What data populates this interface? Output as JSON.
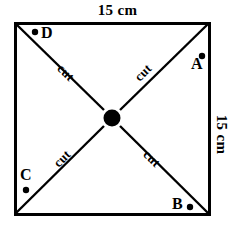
{
  "figure": {
    "colors": {
      "stroke": "#000000",
      "fill": "#ffffff",
      "center_dot": "#000000",
      "marker_dot": "#000000"
    },
    "square": {
      "x": 14,
      "y": 22,
      "width": 196,
      "height": 193,
      "stroke_width": 3
    },
    "center_dot": {
      "cx": 112,
      "cy": 118,
      "r": 8
    },
    "dimensions": [
      {
        "id": "top",
        "text": "15 cm",
        "rotation": 0,
        "side": "top"
      },
      {
        "id": "right",
        "text": "15 cm",
        "rotation": 90,
        "side": "right"
      }
    ],
    "corner_labels": [
      {
        "id": "a",
        "text": "A",
        "dot_position": "upper-right",
        "corner": "top-right"
      },
      {
        "id": "b",
        "text": "B",
        "dot_position": "right",
        "corner": "bottom-right"
      },
      {
        "id": "c",
        "text": "C",
        "dot_position": "below",
        "corner": "bottom-left"
      },
      {
        "id": "d",
        "text": "D",
        "dot_position": "left",
        "corner": "top-left"
      }
    ],
    "cut_labels": [
      {
        "id": "tl",
        "text": "cut",
        "rotation": 45,
        "arm": "top-left"
      },
      {
        "id": "tr",
        "text": "cut",
        "rotation": -45,
        "arm": "top-right"
      },
      {
        "id": "bl",
        "text": "cut",
        "rotation": -45,
        "arm": "bottom-left"
      },
      {
        "id": "br",
        "text": "cut",
        "rotation": 45,
        "arm": "bottom-right"
      }
    ],
    "diagonals": [
      {
        "id": "tl-arm",
        "x1": 15,
        "y1": 23,
        "x2": 104,
        "y2": 110
      },
      {
        "id": "tr-arm",
        "x1": 209,
        "y1": 23,
        "x2": 120,
        "y2": 110
      },
      {
        "id": "bl-arm",
        "x1": 15,
        "y1": 214,
        "x2": 104,
        "y2": 126
      },
      {
        "id": "br-arm",
        "x1": 209,
        "y1": 214,
        "x2": 120,
        "y2": 126
      }
    ],
    "marker_dots": [
      {
        "id": "dot-a",
        "cx": 202,
        "cy": 56
      },
      {
        "id": "dot-b",
        "cx": 190,
        "cy": 207
      },
      {
        "id": "dot-c",
        "cx": 26,
        "cy": 190
      },
      {
        "id": "dot-d",
        "cx": 35,
        "cy": 32
      }
    ]
  }
}
